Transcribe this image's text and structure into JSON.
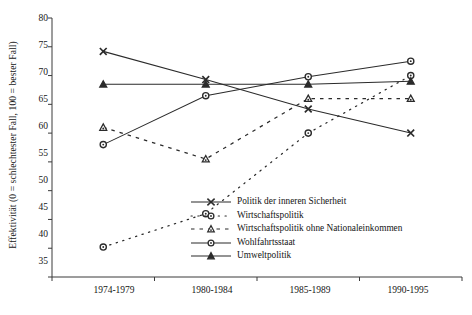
{
  "chart_data": {
    "type": "line",
    "title": "",
    "xlabel": "",
    "ylabel": "Effektivität (0 = schlechtester Fall, 100 = bester Fall)",
    "categories": [
      "1974-1979",
      "1980-1984",
      "1985-1989",
      "1990-1995"
    ],
    "ylim": [
      35,
      80
    ],
    "yticks": [
      35,
      40,
      45,
      50,
      55,
      60,
      65,
      70,
      75,
      80
    ],
    "grid": false,
    "legend_position": "inside-lower-right",
    "series": [
      {
        "name": "Politik der inneren Sicherheit",
        "marker": "x",
        "line": "solid",
        "values": [
          74.2,
          69.3,
          64.2,
          60.0
        ]
      },
      {
        "name": "Wirtschaftspolitik",
        "marker": "open-circle",
        "line": "dotted",
        "values": [
          40.2,
          46.0,
          60.0,
          70.0
        ]
      },
      {
        "name": "Wirtschaftspolitik ohne Nationaleinkommen",
        "marker": "open-triangle",
        "line": "dashed",
        "values": [
          61.0,
          55.5,
          66.0,
          66.0
        ]
      },
      {
        "name": "Wohlfahrtsstaat",
        "marker": "open-circle",
        "line": "solid",
        "values": [
          58.0,
          66.5,
          69.8,
          72.5
        ]
      },
      {
        "name": "Umweltpolitik",
        "marker": "filled-triangle",
        "line": "solid",
        "values": [
          68.5,
          68.5,
          68.5,
          69.0
        ]
      }
    ]
  },
  "axes": {
    "y_tick_labels": [
      "80",
      "75",
      "70",
      "65",
      "60",
      "55",
      "50",
      "45",
      "40",
      "35"
    ],
    "x_tick_labels": [
      "1974-1979",
      "1980-1984",
      "1985-1989",
      "1990-1995"
    ]
  },
  "legend": {
    "items": [
      {
        "label": "Politik der inneren Sicherheit",
        "marker": "x-marker-icon"
      },
      {
        "label": "Wirtschaftspolitik",
        "marker": "open-circle-marker-icon"
      },
      {
        "label": "Wirtschaftspolitik ohne Nationaleinkommen",
        "marker": "open-triangle-marker-icon"
      },
      {
        "label": "Wohlfahrtsstaat",
        "marker": "open-circle-marker-icon"
      },
      {
        "label": "Umweltpolitik",
        "marker": "filled-triangle-marker-icon"
      }
    ]
  },
  "colors": {
    "axis": "#3a3a3a",
    "series": "#2b2b2b",
    "text": "#161616",
    "background": "#ffffff"
  }
}
